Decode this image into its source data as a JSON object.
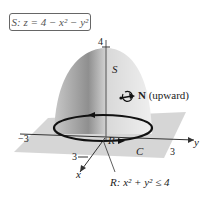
{
  "surface_equation": "S: z = 4 − x² − y²",
  "labels": {
    "z_tick": "4",
    "surface": "S",
    "normal": "N",
    "normal_dir": " (upward)",
    "y_neg": "−3",
    "y_pos": "3",
    "y_axis": "y",
    "x_tick": "3",
    "x_axis": "x",
    "region": "R",
    "curve": "C",
    "region_def": "R: x² + y² ≤ 4"
  },
  "colors": {
    "surface_light": "#e6e6e6",
    "surface_dark": "#9a9a9a",
    "plane": "#cfcfcf",
    "curve": "#111111"
  }
}
